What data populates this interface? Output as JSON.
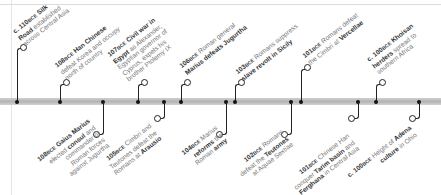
{
  "timeline": {
    "above": [
      {
        "year": "c. 110",
        "era": "BCE",
        "lines": [
          [
            "b",
            "Silk"
          ],
          [
            "b",
            "Road"
          ],
          [
            "t",
            " established"
          ],
          [
            "br"
          ],
          [
            "t",
            "across Central Asia"
          ]
        ],
        "x": 17
      },
      {
        "year": "108",
        "era": "BCE",
        "lines": [
          [
            "t",
            "Han Chinese"
          ],
          [
            "br"
          ],
          [
            "t",
            "defeat Korea and occupy"
          ],
          [
            "br"
          ],
          [
            "t",
            "north of country"
          ]
        ],
        "x": 60
      },
      {
        "year": "107",
        "era": "BCE",
        "lines": [
          [
            "t",
            "Civil war in"
          ],
          [
            "br"
          ],
          [
            "b",
            "Egypt"
          ],
          [
            "t",
            " as Alexander,"
          ],
          [
            "br"
          ],
          [
            "t",
            "Egyptian governor of"
          ],
          [
            "br"
          ],
          [
            "t",
            "Cyprus, expels his"
          ],
          [
            "br"
          ],
          [
            "t",
            "brother Ptolemy IX"
          ]
        ],
        "x": 138
      },
      {
        "year": "106",
        "era": "BCE",
        "lines": [
          [
            "t",
            "Roman general"
          ],
          [
            "br"
          ],
          [
            "b",
            "Marius defeats Jugurtha"
          ]
        ],
        "x": 181
      },
      {
        "year": "103",
        "era": "BCE",
        "lines": [
          [
            "t",
            "Romans suppress"
          ],
          [
            "br"
          ],
          [
            "b",
            "slave revolt in Sicily"
          ]
        ],
        "x": 235
      },
      {
        "year": "101",
        "era": "BCE",
        "lines": [
          [
            "t",
            "Romans defeat"
          ],
          [
            "br"
          ],
          [
            "t",
            "the Cimbri at "
          ],
          [
            "b",
            "Vercellae"
          ]
        ],
        "x": 301
      },
      {
        "year": "c. 100",
        "era": "BCE",
        "lines": [
          [
            "b",
            "Khoisan"
          ],
          [
            "br"
          ],
          [
            "b",
            "herders"
          ],
          [
            "t",
            " spread to"
          ],
          [
            "br"
          ],
          [
            "t",
            "southern Africa"
          ]
        ],
        "x": 376
      }
    ],
    "below": [
      {
        "year": "108",
        "era": "BCE",
        "text": "Gaius Marius elected consul and commander of Roman forces against Jugurtha",
        "x": 103
      },
      {
        "year": "105",
        "era": "BCE",
        "text": "Cimbri and Teutones defeat the Romans at Arausio",
        "x": 162
      },
      {
        "year": "104",
        "era": "BCE",
        "text": "Marius reforms the Roman army",
        "x": 225
      },
      {
        "year": "102",
        "era": "BCE",
        "text": "Romans defeat the Teutones at Aquae Sextiae",
        "x": 291
      },
      {
        "year": "101",
        "era": "BCE",
        "text": "Chinese Han conquer Tarim basin and Ferghana in Central Asia",
        "x": 357
      },
      {
        "year": "c. 100",
        "era": "BCE",
        "text": "Height of Adena culture in Ohio",
        "x": 418
      }
    ]
  },
  "labels": {
    "a0_year": "c. 110",
    "a0_era": "BCE",
    "a0_b1": "Silk",
    "a0_b2": "Road",
    "a0_t1": " established",
    "a0_t2": "across Central Asia",
    "a1_year": "108",
    "a1_era": "BCE",
    "a1_t1": " Han Chinese",
    "a1_t2": "defeat Korea and occupy",
    "a1_t3": "north of country",
    "a2_year": "107",
    "a2_era": "BCE",
    "a2_b1": " Civil war in",
    "a2_b2": "Egypt",
    "a2_t1": " as Alexander,",
    "a2_t2": "Egyptian governor of",
    "a2_t3": "Cyprus, expels his",
    "a2_t4": "brother Ptolemy IX",
    "a3_year": "106",
    "a3_era": "BCE",
    "a3_t1": " Roman general",
    "a3_b1": "Marius defeats Jugurtha",
    "a4_year": "103",
    "a4_era": "BCE",
    "a4_t1": " Romans suppress",
    "a4_b1": "slave revolt in Sicily",
    "a5_year": "101",
    "a5_era": "BCE",
    "a5_t1": " Romans defeat",
    "a5_t2": "the Cimbri at ",
    "a5_b1": "Vercellae",
    "a6_year": "c. 100",
    "a6_era": "BCE",
    "a6_b1": " Khoisan",
    "a6_b2": "herders",
    "a6_t1": " spread to",
    "a6_t2": "southern Africa",
    "b0_year": "108",
    "b0_era": "BCE",
    "b0_b1": " Gaius Marius",
    "b0_t1": "elected ",
    "b0_b2": "consul",
    "b0_t2": " and",
    "b0_t3": "commander of",
    "b0_t4": "Roman forces",
    "b0_t5": "against Jugurtha",
    "b1_year": "105",
    "b1_era": "BCE",
    "b1_t1": " Cimbri and",
    "b1_t2": "Teutones defeat the",
    "b1_t3": "Romans at ",
    "b1_b1": "Arausio",
    "b2_year": "104",
    "b2_era": "BCE",
    "b2_t1": " Marius",
    "b2_b1": "reforms",
    "b2_t2": " the",
    "b2_t3": "Roman ",
    "b2_b2": "army",
    "b3_year": "102",
    "b3_era": "BCE",
    "b3_t1": " Romans",
    "b3_t2": "defeat the ",
    "b3_b1": "Teutones",
    "b3_t3": "at Aquae Sextiae",
    "b4_year": "101",
    "b4_era": "BCE",
    "b4_t1": " Chinese Han",
    "b4_t2": "conquer ",
    "b4_b1": "Tarim basin",
    "b4_t3": " and",
    "b4_b2": "Ferghana",
    "b4_t4": " in Central Asia",
    "b5_year": "c. 100",
    "b5_era": "BCE",
    "b5_t1": " Height of ",
    "b5_b1": "Adena",
    "b5_b2": "culture",
    "b5_t2": " in Ohio"
  },
  "colors": {
    "axis": "#bdbdbd",
    "stem": "#222222",
    "text_bold": "#333333",
    "text_light": "#777777",
    "background": "#ffffff"
  }
}
